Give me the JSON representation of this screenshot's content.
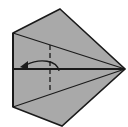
{
  "diagram": {
    "type": "origami-fold-step",
    "colors": {
      "paper": "#a9a9a9",
      "line": "#1a1a1a",
      "background": "#ffffff"
    },
    "elements": [
      {
        "name": "paper-shape",
        "kind": "pentagon"
      },
      {
        "name": "center-crease",
        "kind": "solid-line"
      },
      {
        "name": "upper-diagonal-crease",
        "kind": "solid-line"
      },
      {
        "name": "lower-diagonal-crease",
        "kind": "solid-line"
      },
      {
        "name": "fold-line",
        "kind": "dashed-line"
      },
      {
        "name": "fold-arrow",
        "kind": "curved-arrow",
        "direction": "left"
      }
    ]
  }
}
